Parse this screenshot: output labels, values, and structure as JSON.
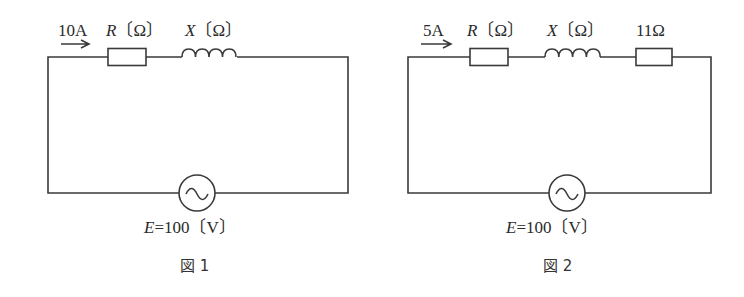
{
  "figures": [
    {
      "caption": "図 1",
      "current_label": "10A",
      "components": [
        {
          "type": "resistor",
          "symbol": "R",
          "unit": "〔Ω〕"
        },
        {
          "type": "inductor",
          "symbol": "X",
          "unit": "〔Ω〕"
        }
      ],
      "source": {
        "symbol": "E",
        "equals": "=",
        "value": "100",
        "unit": "〔V〕",
        "icon": "ac-source-icon"
      }
    },
    {
      "caption": "図 2",
      "current_label": "5A",
      "components": [
        {
          "type": "resistor",
          "symbol": "R",
          "unit": "〔Ω〕"
        },
        {
          "type": "inductor",
          "symbol": "X",
          "unit": "〔Ω〕"
        },
        {
          "type": "resistor",
          "value_label": "11Ω"
        }
      ],
      "source": {
        "symbol": "E",
        "equals": "=",
        "value": "100",
        "unit": "〔V〕",
        "icon": "ac-source-icon"
      }
    }
  ],
  "colors": {
    "line": "#3a3a3a",
    "text": "#2a2a2a"
  }
}
